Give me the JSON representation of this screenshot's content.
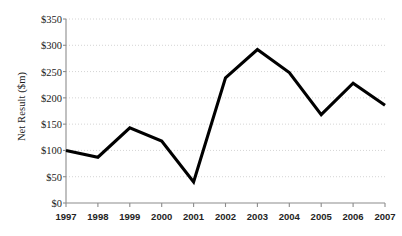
{
  "chart_data": {
    "type": "line",
    "title": "",
    "subtitle": "",
    "xlabel": "",
    "ylabel": "Net Result ($m)",
    "categories": [
      "1997",
      "1998",
      "1999",
      "2000",
      "2001",
      "2002",
      "2003",
      "2004",
      "2005",
      "2006",
      "2007"
    ],
    "x": [
      1997,
      1998,
      1999,
      2000,
      2001,
      2002,
      2003,
      2004,
      2005,
      2006,
      2007
    ],
    "values": [
      100,
      87,
      143,
      118,
      40,
      238,
      292,
      248,
      168,
      228,
      186
    ],
    "series": [
      {
        "name": "Net Result",
        "values": [
          100,
          87,
          143,
          118,
          40,
          238,
          292,
          248,
          168,
          228,
          186
        ]
      }
    ],
    "ylim": [
      0,
      350
    ],
    "ytick_values": [
      0,
      50,
      100,
      150,
      200,
      250,
      300,
      350
    ],
    "ytick_labels": [
      "$0",
      "$50",
      "$100",
      "$150",
      "$200",
      "$250",
      "$300",
      "$350"
    ],
    "xtick_labels": [
      "1997",
      "1998",
      "1999",
      "2000",
      "2001",
      "2002",
      "2003",
      "2004",
      "2005",
      "2006",
      "2007"
    ],
    "grid": "horizontal-dotted",
    "legend": "none",
    "markers": "none",
    "annotations": [],
    "colors": {
      "series_line": "#000000",
      "gridline": "#c9c9c9",
      "axis": "#8c8c8c",
      "text": "#1a1a1a",
      "background": "#ffffff"
    }
  }
}
